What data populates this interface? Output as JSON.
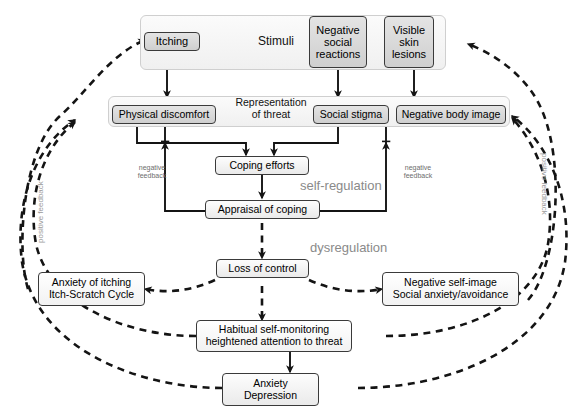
{
  "figure": {
    "background": "#ffffff",
    "line_color": "#1a1a1a",
    "annotation_color": "#8a8a8a"
  },
  "panels": [
    {
      "key": "stimuli",
      "label": "Stimuli"
    },
    {
      "key": "representation",
      "label": "Representation\nof threat",
      "line1": "Representation",
      "line2": "of threat"
    }
  ],
  "nodes": {
    "itching": {
      "label": "Itching",
      "style": "grey"
    },
    "negative_social_reactions": {
      "label": "Negative\nsocial\nreactions",
      "line1": "Negative",
      "line2": "social",
      "line3": "reactions",
      "style": "grey"
    },
    "visible_skin_lesions": {
      "label": "Visible\nskin\nlesions",
      "line1": "Visible",
      "line2": "skin",
      "line3": "lesions",
      "style": "grey"
    },
    "physical_discomfort": {
      "label": "Physical discomfort",
      "style": "grey"
    },
    "social_stigma": {
      "label": "Social stigma",
      "style": "grey"
    },
    "negative_body_image": {
      "label": "Negative body image",
      "style": "grey"
    },
    "coping_efforts": {
      "label": "Coping efforts",
      "style": "light"
    },
    "appraisal_of_coping": {
      "label": "Appraisal of coping",
      "style": "light"
    },
    "loss_of_control": {
      "label": "Loss of control",
      "style": "light"
    },
    "anxiety_of_itching": {
      "label": "Anxiety of itching\nItch-Scratch Cycle",
      "line1": "Anxiety of itching",
      "line2": "Itch-Scratch Cycle",
      "style": "white"
    },
    "negative_self_image": {
      "label": "Negative self-image\nSocial anxiety/avoidance",
      "line1": "Negative self-image",
      "line2": "Social anxiety/avoidance",
      "style": "white"
    },
    "habitual_self_monitoring": {
      "label": "Habitual self-monitoring\nheightened attention to threat",
      "line1": "Habitual self-monitoring",
      "line2": "heightened attention to threat",
      "style": "white"
    },
    "anxiety_depression": {
      "label": "Anxiety\nDepression",
      "line1": "Anxiety",
      "line2": "Depression",
      "style": "light"
    }
  },
  "annotations": {
    "self_regulation": "self-regulation",
    "dysregulation": "dysregulation",
    "negative_feedback_left_line1": "negative",
    "negative_feedback_left_line2": "feedback",
    "negative_feedback_right_line1": "negative",
    "negative_feedback_right_line2": "feedback",
    "positive_feedback_left": "positive feedback",
    "positive_feedback_right": "positive feedback"
  },
  "caption": {
    "text": ""
  },
  "edges": [
    {
      "from": "visible_skin_lesions",
      "to": "negative_social_reactions",
      "kind": "solid"
    },
    {
      "from": "itching",
      "to": "physical_discomfort",
      "kind": "solid"
    },
    {
      "from": "negative_social_reactions",
      "to": "social_stigma",
      "kind": "solid"
    },
    {
      "from": "visible_skin_lesions",
      "to": "negative_body_image",
      "kind": "solid"
    },
    {
      "from": "physical_discomfort",
      "to": "coping_efforts",
      "kind": "solid"
    },
    {
      "from": "social_stigma",
      "to": "coping_efforts",
      "kind": "solid"
    },
    {
      "from": "coping_efforts",
      "to": "appraisal_of_coping",
      "kind": "solid"
    },
    {
      "from": "appraisal_of_coping",
      "to": "physical_discomfort",
      "kind": "solid",
      "label": "negative feedback"
    },
    {
      "from": "appraisal_of_coping",
      "to": "negative_body_image",
      "kind": "solid",
      "label": "negative feedback"
    },
    {
      "from": "appraisal_of_coping",
      "to": "loss_of_control",
      "kind": "dashed",
      "label": "dysregulation"
    },
    {
      "from": "loss_of_control",
      "to": "anxiety_of_itching",
      "kind": "dashed"
    },
    {
      "from": "loss_of_control",
      "to": "negative_self_image",
      "kind": "dashed"
    },
    {
      "from": "loss_of_control",
      "to": "habitual_self_monitoring",
      "kind": "dashed"
    },
    {
      "from": "habitual_self_monitoring",
      "to": "anxiety_depression",
      "kind": "solid"
    },
    {
      "from": "anxiety_of_itching",
      "to": "itching",
      "kind": "dashed",
      "label": "positive feedback"
    },
    {
      "from": "habitual_self_monitoring",
      "to": "physical_discomfort",
      "kind": "dashed",
      "label": "positive feedback"
    },
    {
      "from": "anxiety_depression",
      "to": "physical_discomfort",
      "kind": "dashed",
      "label": "positive feedback"
    },
    {
      "from": "negative_self_image",
      "to": "visible_skin_lesions",
      "kind": "dashed",
      "label": "positive feedback"
    },
    {
      "from": "habitual_self_monitoring",
      "to": "negative_body_image",
      "kind": "dashed",
      "label": "positive feedback"
    },
    {
      "from": "anxiety_depression",
      "to": "negative_body_image",
      "kind": "dashed",
      "label": "positive feedback"
    }
  ]
}
